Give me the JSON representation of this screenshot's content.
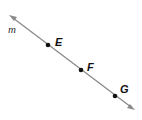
{
  "diagram": {
    "line_label": "m",
    "points": [
      {
        "label": "E",
        "x": 48,
        "y": 44
      },
      {
        "label": "F",
        "x": 80,
        "y": 70
      },
      {
        "label": "G",
        "x": 115,
        "y": 96
      }
    ],
    "line": {
      "x1": 9,
      "y1": 15,
      "x2": 135,
      "y2": 110,
      "color": "#888888"
    }
  }
}
